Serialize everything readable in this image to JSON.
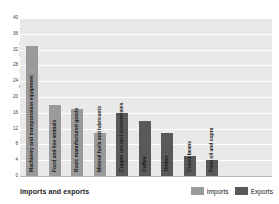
{
  "footer": {
    "title": "Imports and exports"
  },
  "legend": [
    {
      "label": "Imports",
      "color": "#9a9a9a"
    },
    {
      "label": "Exports",
      "color": "#595959"
    }
  ],
  "colors": {
    "imports": "#9a9a9a",
    "exports": "#595959",
    "plot_background": "#e9e9e9",
    "gridline": "#ffffff",
    "text": "#1c1c1c"
  },
  "chart_data": {
    "type": "bar",
    "title": "Imports and exports",
    "xlabel": "",
    "ylabel": "Percentage of total",
    "ylim": [
      0,
      40
    ],
    "yticks": [
      40,
      36,
      32,
      28,
      24,
      20,
      16,
      12,
      8,
      4,
      0
    ],
    "grid": true,
    "legend_position": "bottom-right",
    "categories": [
      "Machinery and transportation equipment",
      "Food and live animals",
      "Basic manufactured goods",
      "Mineral fuels and lubricants",
      "Copper ore and concentrates",
      "Coffee",
      "Timber",
      "Cocoa beans",
      "Palm oil and copra"
    ],
    "bars": [
      {
        "label": "Machinery and transportation equipment",
        "value": 33,
        "series": "Imports"
      },
      {
        "label": "Food and live animals",
        "value": 18,
        "series": "Imports"
      },
      {
        "label": "Basic manufactured goods",
        "value": 17,
        "series": "Imports"
      },
      {
        "label": "Mineral fuels and lubricants",
        "value": 11,
        "series": "Imports"
      },
      {
        "label": "Copper ore and concentrates",
        "value": 16,
        "series": "Exports"
      },
      {
        "label": "Coffee",
        "value": 14,
        "series": "Exports"
      },
      {
        "label": "Timber",
        "value": 11,
        "series": "Exports"
      },
      {
        "label": "Cocoa beans",
        "value": 5,
        "series": "Exports"
      },
      {
        "label": "Palm oil and copra",
        "value": 4,
        "series": "Exports"
      }
    ]
  }
}
